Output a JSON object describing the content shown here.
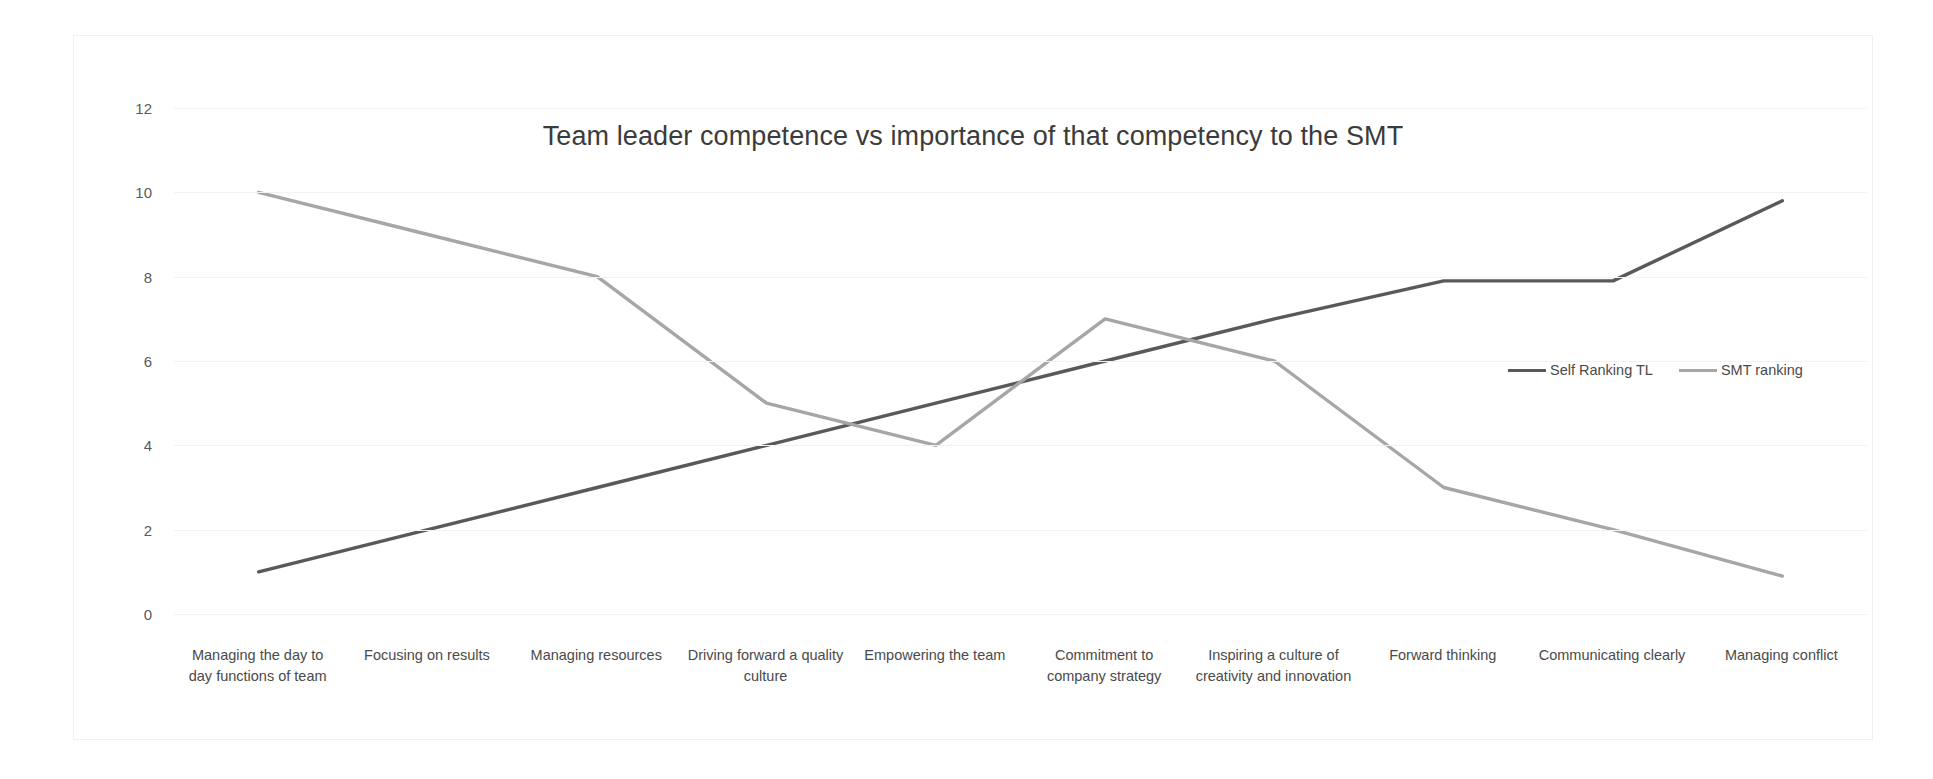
{
  "chart_data": {
    "type": "line",
    "title": "Team leader competence vs importance of that competency to the SMT",
    "xlabel": "",
    "ylabel": "",
    "ylim": [
      0,
      12
    ],
    "yticks": [
      0,
      2,
      4,
      6,
      8,
      10,
      12
    ],
    "grid": true,
    "legend_position": "center-right",
    "categories": [
      "Managing the day to day functions of team",
      "Focusing on  results",
      "Managing resources",
      "Driving forward a quality culture",
      "Empowering the team",
      "Commitment to company strategy",
      "Inspiring a culture of creativity and innovation",
      "Forward thinking",
      "Communicating clearly",
      "Managing conflict"
    ],
    "series": [
      {
        "name": "Self Ranking TL",
        "color": "#595959",
        "values": [
          1,
          2,
          3,
          4,
          5,
          6,
          7,
          7.9,
          7.9,
          9.8
        ]
      },
      {
        "name": "SMT ranking",
        "color": "#a6a6a6",
        "values": [
          10,
          9,
          8,
          5,
          4,
          7,
          6,
          3,
          2,
          0.9
        ]
      }
    ]
  }
}
